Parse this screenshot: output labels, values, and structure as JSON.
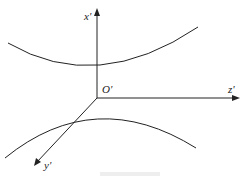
{
  "diagram": {
    "type": "hyperbolic surface cross-section with 3D axes",
    "axes": {
      "x": "x'",
      "y": "y'",
      "z": "z'",
      "origin": "O'"
    },
    "curves": [
      "upper branch (concave up)",
      "lower branch (concave down)"
    ]
  }
}
